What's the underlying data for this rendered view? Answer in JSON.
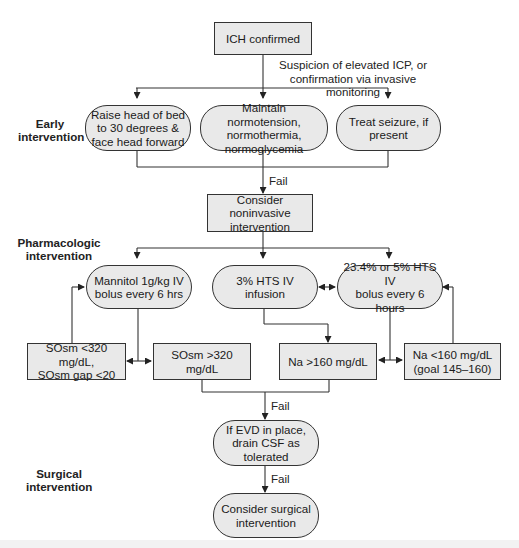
{
  "diagram": {
    "colors": {
      "node_fill": "#e9e9e9",
      "stroke": "#333333",
      "text": "#1a1a1a"
    },
    "sections": {
      "early": "Early\nintervention",
      "pharmacologic": "Pharmacologic\nintervention",
      "surgical": "Surgical\nintervention"
    },
    "nodes": {
      "start": "ICH confirmed",
      "trigger_label": "Suspicion of elevated ICP, or\nconfirmation via invasive monitoring",
      "early": [
        "Raise head of bed\nto 30 degrees &\nface head forward",
        "Maintain normotension,\nnormothermia,\nnormoglycemia",
        "Treat seizure, if\npresent"
      ],
      "noninvasive": "Consider noninvasive\nintervention",
      "pharma": [
        "Mannitol 1g/kg IV\nbolus every 6 hrs",
        "3% HTS IV infusion",
        "23.4% or 5% HTS IV\nbolus every 6 hours"
      ],
      "criteria": [
        "SOsm <320 mg/dL,\nSOsm gap <20",
        "SOsm >320 mg/dL",
        "Na >160 mg/dL",
        "Na <160 mg/dL\n(goal 145–160)"
      ],
      "evd": "If EVD in place,\ndrain CSF as\ntolerated",
      "surgical": "Consider surgical\nintervention"
    },
    "edge_labels": {
      "fail1": "Fail",
      "fail2": "Fail",
      "fail3": "Fail"
    }
  }
}
